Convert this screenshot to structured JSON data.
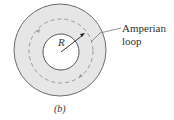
{
  "figure": {
    "panel_label": "(b)",
    "radius_label": "R",
    "callout_label_line1": "Amperian",
    "callout_label_line2": "loop"
  },
  "colors": {
    "ring_fill": "#e6e6e6",
    "stroke": "#6e6e6e",
    "dashed": "#999999",
    "arrow": "#222222"
  }
}
